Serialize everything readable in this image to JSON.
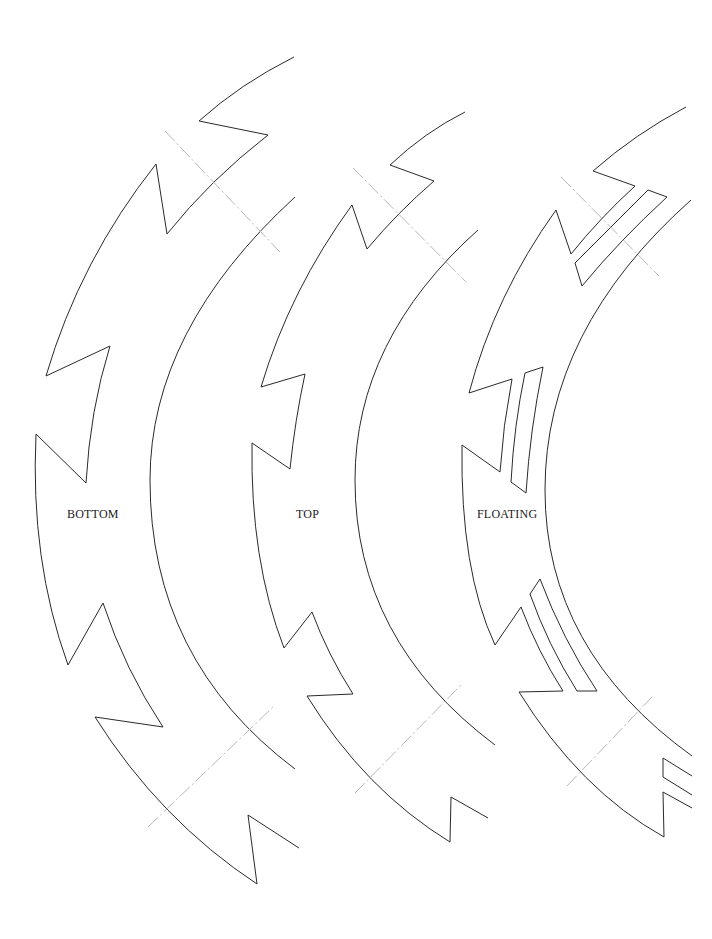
{
  "pieces": [
    {
      "id": "bottom",
      "label": "BOTTOM"
    },
    {
      "id": "top",
      "label": "TOP"
    },
    {
      "id": "floating",
      "label": "FLOATING"
    }
  ],
  "colors": {
    "cut_line": "#2a2a2a",
    "guide_line": "#b8b8b8",
    "background": "#ffffff"
  }
}
